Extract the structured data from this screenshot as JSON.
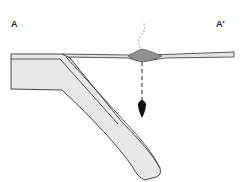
{
  "diagram": {
    "type": "cross-section",
    "labels": {
      "left": "A",
      "right": "A'"
    },
    "colors": {
      "outline": "#333333",
      "plate_fill": "#e6e6e6",
      "crust_fill": "#d8d8d8",
      "volcano_fill": "#8a8a8a",
      "arrow": "#111111",
      "smoke": "#bbbbbb"
    }
  }
}
